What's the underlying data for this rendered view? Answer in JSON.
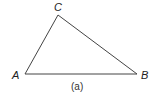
{
  "diagram": {
    "type": "triangle",
    "stroke_color": "#444444",
    "vertices": [
      {
        "label": "A",
        "x": 25,
        "y": 74
      },
      {
        "label": "B",
        "x": 137,
        "y": 74
      },
      {
        "label": "C",
        "x": 58,
        "y": 15
      }
    ],
    "caption": "(a)"
  }
}
